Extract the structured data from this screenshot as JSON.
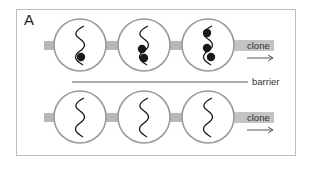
{
  "figure": {
    "panel_label": "A",
    "colors": {
      "frame": "#bdbdbd",
      "cell_outline": "#9a9a9a",
      "connector": "#b8b8b8",
      "clone_bar": "#c4c4c4",
      "strand": "#1a1a1a",
      "barrier_line": "#555555"
    },
    "rows": [
      {
        "name": "top-row",
        "cells": [
          {
            "index": 1,
            "beads": 1
          },
          {
            "index": 2,
            "beads": 2
          },
          {
            "index": 3,
            "beads": 3
          }
        ],
        "output_label": "clone"
      },
      {
        "name": "bottom-row",
        "cells": [
          {
            "index": 1,
            "beads": 0
          },
          {
            "index": 2,
            "beads": 0
          },
          {
            "index": 3,
            "beads": 0
          }
        ],
        "output_label": "clone"
      }
    ],
    "barrier_label": "barrier",
    "icons": [
      "circle-cell-icon",
      "wavy-strand-icon",
      "bead-icon",
      "arrow-right-icon",
      "connector-icon"
    ]
  }
}
